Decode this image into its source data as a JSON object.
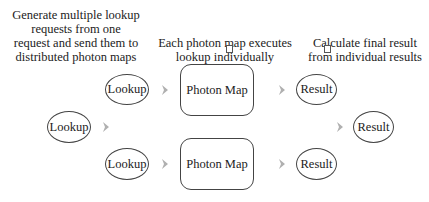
{
  "captions": {
    "generate": {
      "lines": [
        "Generate multiple lookup",
        "requests from one",
        "request and send them to",
        "distributed photon maps"
      ]
    },
    "execute": {
      "lines": [
        "Each photon map executes",
        "lookup individually"
      ]
    },
    "calculate": {
      "lines": [
        "Calculate final result",
        "from individual results"
      ]
    }
  },
  "nodes": {
    "lookup_source": "Lookup",
    "lookup_top": "Lookup",
    "lookup_bottom": "Lookup",
    "photon_map_top": "Photon Map",
    "photon_map_bottom": "Photon Map",
    "result_top": "Result",
    "result_bottom": "Result",
    "result_final": "Result"
  },
  "colors": {
    "stroke": "#444444",
    "arrow": "#b0b0b0",
    "text": "#222222"
  }
}
